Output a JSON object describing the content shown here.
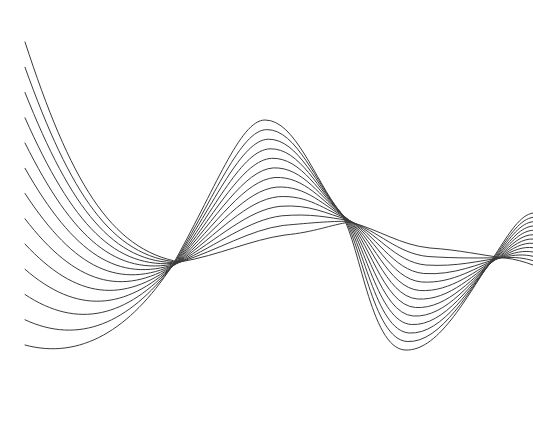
{
  "artwork": {
    "subject": "abstract wave line pattern",
    "line_count": 13,
    "line_color": "#3a3a3a",
    "background_color": "#ffffff"
  }
}
